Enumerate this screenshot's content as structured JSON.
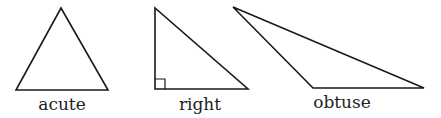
{
  "figure": {
    "width": 441,
    "height": 118,
    "stroke_color": "#1a1a1a",
    "background": "#ffffff"
  },
  "triangles": [
    {
      "name": "acute",
      "label": "acute",
      "points": "61,8 16,90 108,90",
      "label_x": 62,
      "label_y": 110
    },
    {
      "name": "right",
      "label": "right",
      "points": "155,8 155,89 248,89",
      "right_angle_mark": "155,79 165,79 165,89",
      "label_x": 200,
      "label_y": 110
    },
    {
      "name": "obtuse",
      "label": "obtuse",
      "points": "233,7 313,88 424,88",
      "label_x": 342,
      "label_y": 108
    }
  ]
}
